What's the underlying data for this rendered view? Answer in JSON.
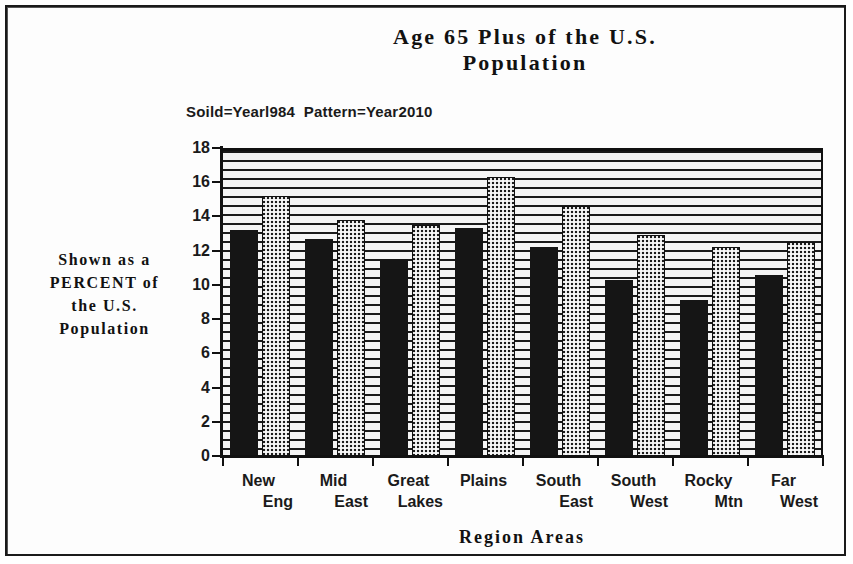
{
  "frame": {
    "border_color": "#1a1a1a"
  },
  "title": {
    "line1": "Age 65 Plus of the U.S.",
    "line2": "Population"
  },
  "legend": {
    "text": "Soild=Yearl984  Pattern=Year2010",
    "solid_label": "Soild=Yearl984",
    "pattern_label": "Pattern=Year2010"
  },
  "y_caption": {
    "line1": "Shown as a",
    "line2": "PERCENT of",
    "line3": "the U.S.",
    "line4": "Population"
  },
  "x_axis_title": "Region  Areas",
  "chart_data": {
    "type": "bar",
    "title": "Age 65 Plus of the U.S. Population",
    "subtitle": "Soild=Yearl984  Pattern=Year2010",
    "xlabel": "Region  Areas",
    "ylabel": "Shown as a PERCENT of the U.S. Population",
    "ylim": [
      0,
      18
    ],
    "yticks": [
      0,
      2,
      4,
      6,
      8,
      10,
      12,
      14,
      16,
      18
    ],
    "ytick_labels": [
      "0",
      "2",
      "4",
      "6",
      "8",
      "10",
      "12",
      "14",
      "16",
      "18"
    ],
    "grid": "horizontal",
    "legend_position": "above-plot-left",
    "categories": [
      "New Eng",
      "Mid East",
      "Great Lakes",
      "Plains",
      "South East",
      "South West",
      "Rocky Mtn",
      "Far West"
    ],
    "category_lines": [
      [
        "New",
        "Eng"
      ],
      [
        "Mid",
        "East"
      ],
      [
        "Great",
        "Lakes"
      ],
      [
        "Plains",
        ""
      ],
      [
        "South",
        "East"
      ],
      [
        "South",
        "West"
      ],
      [
        "Rocky",
        "Mtn"
      ],
      [
        "Far",
        "West"
      ]
    ],
    "series": [
      {
        "name": "Soild=Yearl984",
        "fill": "solid",
        "color": "#151515",
        "values": [
          13.2,
          12.7,
          11.5,
          13.3,
          12.2,
          10.3,
          9.1,
          10.6
        ]
      },
      {
        "name": "Pattern=Year2010",
        "fill": "pattern",
        "color": "#1c1c1c",
        "values": [
          15.2,
          13.8,
          13.5,
          16.3,
          14.6,
          12.9,
          12.2,
          12.5
        ]
      }
    ]
  }
}
